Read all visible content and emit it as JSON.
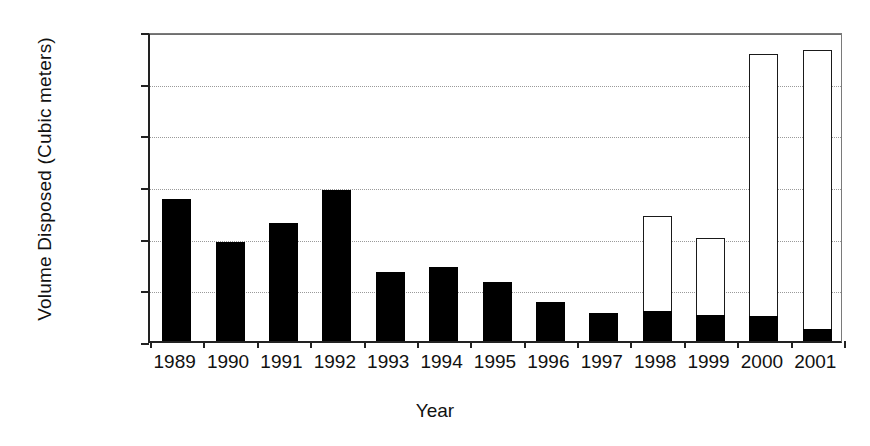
{
  "chart_data": {
    "type": "bar",
    "title": "",
    "xlabel": "Year",
    "ylabel": "Volume Disposed (Cubic meters)",
    "ylim": [
      0,
      120000
    ],
    "ytick_labels": [
      "120000",
      "100000",
      "80000",
      "60000",
      "40000",
      "20000",
      "0"
    ],
    "ytick_values": [
      120000,
      100000,
      80000,
      60000,
      40000,
      20000,
      0
    ],
    "grid": true,
    "legend": "none",
    "stacked": true,
    "categories": [
      "1989",
      "1990",
      "1991",
      "1992",
      "1993",
      "1994",
      "1995",
      "1996",
      "1997",
      "1998",
      "1999",
      "2000",
      "2001"
    ],
    "series": [
      {
        "name": "black-segment",
        "color": "#000000",
        "values": [
          55000,
          38500,
          45500,
          58500,
          26700,
          28700,
          22800,
          15000,
          11000,
          11800,
          10200,
          9500,
          4800
        ]
      },
      {
        "name": "white-segment",
        "color": "#ffffff",
        "values": [
          0,
          0,
          0,
          0,
          0,
          0,
          0,
          0,
          0,
          36700,
          29600,
          101500,
          107700
        ]
      }
    ],
    "totals": [
      55000,
      38500,
      45500,
      58500,
      26700,
      28700,
      22800,
      15000,
      11000,
      48500,
      39800,
      111000,
      112500
    ]
  }
}
